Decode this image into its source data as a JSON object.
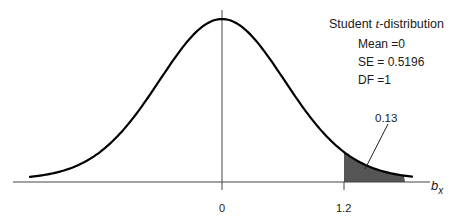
{
  "chart_data": {
    "type": "area",
    "title": "Student t-distribution",
    "title_parts": {
      "prefix": "Student ",
      "italic": "t",
      "suffix": "-distribution"
    },
    "parameters": [
      {
        "name": "Mean",
        "label": "Mean =0",
        "value": 0
      },
      {
        "name": "SE",
        "label": "SE = 0.5196",
        "value": 0.5196
      },
      {
        "name": "DF",
        "label": "DF =1",
        "value": 1
      }
    ],
    "xlabel": "b_x",
    "xlabel_parts": {
      "main": "b",
      "sub": "x"
    },
    "ylabel": "",
    "x_ticks": [
      {
        "value": 0,
        "label": "0"
      },
      {
        "value": 1.2,
        "label": "1.2"
      }
    ],
    "shaded_region": {
      "from": 1.2,
      "to": "right tail",
      "area": 0.13,
      "label": "0.13",
      "color": "#555555"
    },
    "curve": {
      "distribution": "t",
      "df": 1,
      "location": 0,
      "scale": 0.5196,
      "color": "#000000"
    },
    "grid": false,
    "legend": "none"
  },
  "labels": {
    "title_prefix": "Student ",
    "title_italic": "t",
    "title_suffix": "-distribution",
    "mean": "Mean =0",
    "se": "SE = 0.5196",
    "df": "DF =1",
    "tick_zero": "0",
    "tick_cut": "1.2",
    "axis_main": "b",
    "axis_sub": "x",
    "area": "0.13"
  }
}
